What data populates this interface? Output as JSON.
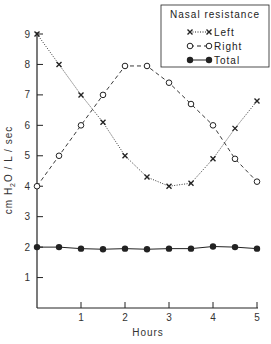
{
  "chart_data": {
    "type": "line",
    "title": "",
    "xlabel": "Hours",
    "ylabel": "cm H2O / L / sec",
    "ylabel_parts": {
      "pre": "cm H",
      "sub": "2",
      "post": "O / L / sec"
    },
    "xlim": [
      0,
      5
    ],
    "ylim": [
      0,
      9
    ],
    "x_ticks": [
      1,
      2,
      3,
      4,
      5
    ],
    "y_ticks": [
      1,
      2,
      3,
      4,
      5,
      6,
      7,
      8,
      9
    ],
    "grid": false,
    "legend_position": "upper right",
    "legend_title": "Nasal resistance",
    "x": [
      0,
      0.5,
      1,
      1.5,
      2,
      2.5,
      3,
      3.5,
      4,
      4.5,
      5
    ],
    "series": [
      {
        "name": "Left",
        "marker": "x",
        "line": "dotted",
        "values": [
          9.0,
          8.0,
          7.0,
          6.1,
          5.0,
          4.3,
          4.0,
          4.1,
          4.9,
          5.9,
          6.8
        ]
      },
      {
        "name": "Right",
        "marker": "open-circle",
        "line": "dashed",
        "values": [
          4.0,
          5.0,
          6.0,
          7.0,
          7.95,
          7.95,
          7.4,
          6.7,
          6.0,
          4.9,
          4.15
        ]
      },
      {
        "name": "Total",
        "marker": "filled-circle",
        "line": "solid",
        "values": [
          2.0,
          2.0,
          1.95,
          1.93,
          1.95,
          1.93,
          1.95,
          1.95,
          2.02,
          2.0,
          1.95
        ]
      }
    ]
  },
  "colors": {
    "ink": "#222222",
    "background": "#ffffff"
  }
}
